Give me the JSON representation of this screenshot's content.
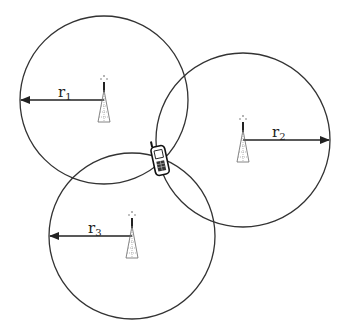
{
  "diagram": {
    "type": "trilateration",
    "stroke_color": "#333333",
    "background": "#ffffff",
    "towers": [
      {
        "id": "tower-1",
        "cx": 104,
        "cy": 100,
        "r": 84,
        "label_base": "r",
        "label_sub": "1",
        "arrow_dir": "left"
      },
      {
        "id": "tower-2",
        "cx": 243,
        "cy": 140,
        "r": 87,
        "label_base": "r",
        "label_sub": "2",
        "arrow_dir": "right"
      },
      {
        "id": "tower-3",
        "cx": 132,
        "cy": 236,
        "r": 83,
        "label_base": "r",
        "label_sub": "3",
        "arrow_dir": "left"
      }
    ],
    "phone": {
      "x": 160,
      "y": 158,
      "icon": "mobile-phone-icon"
    }
  }
}
